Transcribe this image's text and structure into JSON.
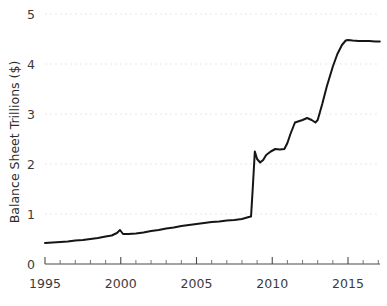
{
  "chart_data": {
    "type": "line",
    "title": "",
    "subtitle": "",
    "xlabel": "",
    "ylabel": "Balance Sheet Trillions ($)",
    "xlim": [
      1994.5,
      2017.2
    ],
    "ylim": [
      0,
      5
    ],
    "grid": true,
    "grid_axis": "y",
    "legend": false,
    "legend_position": "none",
    "line_color": "#151515",
    "grid_color": "#e2e2e2",
    "axis_color": "#4a4a4a",
    "text_color": "#3b3b3b",
    "background_color": "#ffffff",
    "y_ticks": [
      0,
      1,
      2,
      3,
      4,
      5
    ],
    "y_tick_labels": [
      "0",
      "1",
      "2",
      "3",
      "4",
      "5"
    ],
    "x_ticks": [
      1995,
      2000,
      2005,
      2010,
      2015
    ],
    "x_tick_labels": [
      "1995",
      "2000",
      "2005",
      "2010",
      "2015"
    ],
    "x_minor_tick_interval": 1,
    "series": [
      {
        "name": "Federal Reserve Balance Sheet",
        "x": [
          1995.0,
          1995.5,
          1996.0,
          1996.5,
          1997.0,
          1997.5,
          1998.0,
          1998.5,
          1999.0,
          1999.4,
          1999.75,
          1999.95,
          2000.15,
          2000.5,
          2001.0,
          2001.5,
          2002.0,
          2002.5,
          2003.0,
          2003.5,
          2004.0,
          2004.5,
          2005.0,
          2005.5,
          2006.0,
          2006.5,
          2007.0,
          2007.5,
          2008.0,
          2008.45,
          2008.6,
          2008.72,
          2008.85,
          2009.0,
          2009.2,
          2009.4,
          2009.6,
          2009.9,
          2010.2,
          2010.5,
          2010.8,
          2011.0,
          2011.2,
          2011.5,
          2011.8,
          2012.0,
          2012.3,
          2012.6,
          2012.85,
          2013.0,
          2013.3,
          2013.6,
          2014.0,
          2014.3,
          2014.6,
          2014.85,
          2015.0,
          2015.3,
          2015.7,
          2016.0,
          2016.4,
          2016.8,
          2017.1
        ],
        "y": [
          0.42,
          0.43,
          0.44,
          0.45,
          0.47,
          0.48,
          0.5,
          0.52,
          0.55,
          0.57,
          0.62,
          0.68,
          0.6,
          0.6,
          0.61,
          0.63,
          0.66,
          0.68,
          0.71,
          0.73,
          0.76,
          0.78,
          0.8,
          0.82,
          0.84,
          0.85,
          0.87,
          0.88,
          0.9,
          0.94,
          0.95,
          1.55,
          2.25,
          2.1,
          2.03,
          2.08,
          2.18,
          2.25,
          2.3,
          2.29,
          2.3,
          2.42,
          2.6,
          2.83,
          2.86,
          2.88,
          2.92,
          2.88,
          2.83,
          2.88,
          3.2,
          3.55,
          3.95,
          4.2,
          4.38,
          4.47,
          4.48,
          4.47,
          4.46,
          4.46,
          4.46,
          4.45,
          4.45
        ]
      }
    ]
  }
}
